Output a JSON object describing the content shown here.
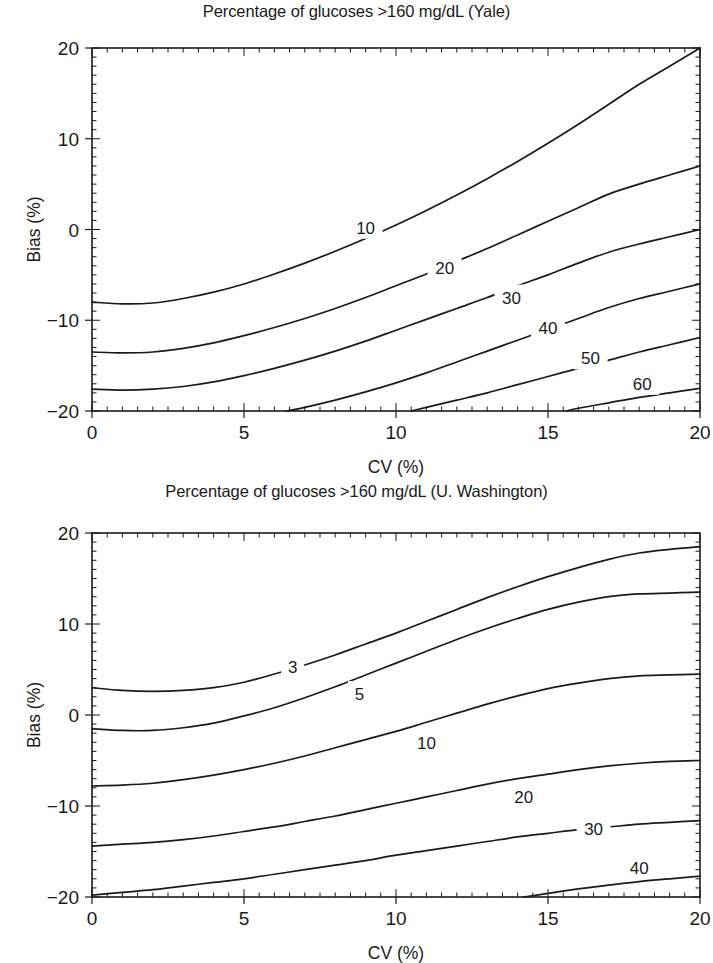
{
  "figure": {
    "background": "#ffffff",
    "line_color": "#1a1a1a"
  },
  "panels": [
    {
      "id": "yale",
      "title": "Percentage of glucoses >160 mg/dL (Yale)",
      "xlabel": "CV (%)",
      "ylabel": "Bias (%)"
    },
    {
      "id": "uwashington",
      "title": "Percentage of glucoses >160 mg/dL (U. Washington)",
      "xlabel": "CV (%)",
      "ylabel": "Bias (%)"
    }
  ],
  "chart_data": [
    {
      "type": "line",
      "id": "yale",
      "title": "Percentage of glucoses >160 mg/dL (Yale)",
      "xlabel": "CV (%)",
      "ylabel": "Bias (%)",
      "xlim": [
        0,
        20
      ],
      "ylim": [
        -20,
        20
      ],
      "xticks": [
        0,
        5,
        10,
        15,
        20
      ],
      "yticks": [
        -20,
        -10,
        0,
        10,
        20
      ],
      "xtick_labels": [
        "0",
        "5",
        "10",
        "15",
        "20"
      ],
      "ytick_labels": [
        "-20",
        "-10",
        "0",
        "10",
        "20"
      ],
      "grid": false,
      "legend": "none",
      "contour_label_unit": "%",
      "series": [
        {
          "name": "10",
          "label_at": [
            9.0,
            0.2
          ],
          "x": [
            0,
            1,
            2,
            3,
            4,
            5,
            6,
            7,
            8,
            9,
            10,
            11,
            12,
            13,
            14,
            15,
            16,
            17,
            18,
            19,
            20
          ],
          "y": [
            -8.0,
            -8.2,
            -8.1,
            -7.6,
            -6.9,
            -6.0,
            -4.9,
            -3.7,
            -2.4,
            -1.0,
            0.5,
            2.1,
            3.8,
            5.6,
            7.5,
            9.5,
            11.6,
            13.8,
            16.0,
            18.0,
            20.0
          ]
        },
        {
          "name": "20",
          "label_at": [
            11.6,
            -4.2
          ],
          "x": [
            0,
            1,
            2,
            3,
            4,
            5,
            6,
            7,
            8,
            9,
            10,
            11,
            12,
            13,
            14,
            15,
            16,
            17,
            18,
            19,
            20
          ],
          "y": [
            -13.5,
            -13.6,
            -13.5,
            -13.1,
            -12.5,
            -11.7,
            -10.8,
            -9.8,
            -8.7,
            -7.5,
            -6.2,
            -4.9,
            -3.5,
            -2.1,
            -0.6,
            0.9,
            2.4,
            3.9,
            5.0,
            6.0,
            7.0
          ]
        },
        {
          "name": "30",
          "label_at": [
            13.8,
            -7.5
          ],
          "x": [
            0,
            1,
            2,
            3,
            4,
            5,
            6,
            7,
            8,
            9,
            10,
            11,
            12,
            13,
            14,
            15,
            16,
            17,
            18,
            19,
            20
          ],
          "y": [
            -17.6,
            -17.7,
            -17.6,
            -17.3,
            -16.8,
            -16.1,
            -15.3,
            -14.4,
            -13.4,
            -12.3,
            -11.1,
            -9.9,
            -8.7,
            -7.5,
            -6.2,
            -5.0,
            -3.7,
            -2.5,
            -1.6,
            -0.8,
            0.0
          ]
        },
        {
          "name": "40",
          "label_at": [
            15.0,
            -10.9
          ],
          "x": [
            6.4,
            7,
            8,
            9,
            10,
            11,
            12,
            13,
            14,
            15,
            16,
            17,
            18,
            19,
            20
          ],
          "y": [
            -20.0,
            -19.6,
            -18.8,
            -17.9,
            -16.9,
            -15.8,
            -14.6,
            -13.4,
            -12.2,
            -11.0,
            -9.8,
            -8.6,
            -7.6,
            -6.8,
            -6.0
          ]
        },
        {
          "name": "50",
          "label_at": [
            16.4,
            -14.2
          ],
          "x": [
            10.5,
            11,
            12,
            13,
            14,
            15,
            16,
            17,
            18,
            19,
            20
          ],
          "y": [
            -20.0,
            -19.6,
            -18.8,
            -18.0,
            -17.1,
            -16.2,
            -15.3,
            -14.4,
            -13.5,
            -12.7,
            -11.9
          ]
        },
        {
          "name": "60",
          "label_at": [
            18.1,
            -17.0
          ],
          "x": [
            15.6,
            16,
            17,
            18,
            19,
            20
          ],
          "y": [
            -20.0,
            -19.7,
            -19.1,
            -18.5,
            -18.0,
            -17.5
          ]
        }
      ]
    },
    {
      "type": "line",
      "id": "uwashington",
      "title": "Percentage of glucoses >160 mg/dL (U. Washington)",
      "xlabel": "CV (%)",
      "ylabel": "Bias (%)",
      "xlim": [
        0,
        20
      ],
      "ylim": [
        -20,
        20
      ],
      "xticks": [
        0,
        5,
        10,
        15,
        20
      ],
      "yticks": [
        -20,
        -10,
        0,
        10,
        20
      ],
      "xtick_labels": [
        "0",
        "5",
        "10",
        "15",
        "20"
      ],
      "ytick_labels": [
        "-20",
        "-10",
        "0",
        "10",
        "20"
      ],
      "grid": false,
      "legend": "none",
      "contour_label_unit": "%",
      "series": [
        {
          "name": "3",
          "label_at": [
            6.6,
            5.3
          ],
          "x": [
            0,
            1,
            2,
            3,
            4,
            5,
            6,
            7,
            8,
            9,
            10,
            11,
            12,
            13,
            14,
            15,
            16,
            17,
            18,
            19,
            20
          ],
          "y": [
            3.0,
            2.7,
            2.6,
            2.7,
            3.0,
            3.6,
            4.5,
            5.5,
            6.6,
            7.8,
            9.0,
            10.3,
            11.6,
            12.9,
            14.1,
            15.2,
            16.2,
            17.1,
            17.8,
            18.2,
            18.5
          ]
        },
        {
          "name": "5",
          "label_at": [
            8.8,
            2.3
          ],
          "x": [
            0,
            1,
            2,
            3,
            4,
            5,
            6,
            7,
            8,
            9,
            10,
            11,
            12,
            13,
            14,
            15,
            16,
            17,
            18,
            19,
            20
          ],
          "y": [
            -1.5,
            -1.7,
            -1.7,
            -1.4,
            -0.9,
            -0.1,
            0.8,
            1.9,
            3.1,
            4.4,
            5.7,
            7.0,
            8.3,
            9.5,
            10.6,
            11.6,
            12.4,
            13.0,
            13.3,
            13.4,
            13.5
          ]
        },
        {
          "name": "10",
          "label_at": [
            11.0,
            -3.1
          ],
          "x": [
            0,
            1,
            2,
            3,
            4,
            5,
            6,
            7,
            8,
            9,
            10,
            11,
            12,
            13,
            14,
            15,
            16,
            17,
            18,
            19,
            20
          ],
          "y": [
            -7.8,
            -7.7,
            -7.5,
            -7.1,
            -6.6,
            -6.0,
            -5.3,
            -4.5,
            -3.6,
            -2.7,
            -1.8,
            -0.8,
            0.2,
            1.2,
            2.1,
            2.9,
            3.5,
            4.0,
            4.3,
            4.4,
            4.5
          ]
        },
        {
          "name": "20",
          "label_at": [
            14.2,
            -9.0
          ],
          "x": [
            0,
            1,
            2,
            3,
            4,
            5,
            6,
            7,
            8,
            9,
            10,
            11,
            12,
            13,
            14,
            15,
            16,
            17,
            18,
            19,
            20
          ],
          "y": [
            -14.4,
            -14.2,
            -14.0,
            -13.7,
            -13.3,
            -12.8,
            -12.3,
            -11.7,
            -11.1,
            -10.4,
            -9.7,
            -9.0,
            -8.3,
            -7.6,
            -7.0,
            -6.5,
            -6.0,
            -5.6,
            -5.3,
            -5.1,
            -5.0
          ]
        },
        {
          "name": "30",
          "label_at": [
            16.5,
            -12.5
          ],
          "x": [
            0,
            1,
            2,
            3,
            4,
            5,
            6,
            7,
            8,
            9,
            10,
            11,
            12,
            13,
            14,
            15,
            16,
            17,
            18,
            19,
            20
          ],
          "y": [
            -19.8,
            -19.5,
            -19.2,
            -18.8,
            -18.4,
            -18.0,
            -17.5,
            -17.0,
            -16.5,
            -16.0,
            -15.4,
            -14.9,
            -14.4,
            -13.9,
            -13.4,
            -13.0,
            -12.6,
            -12.3,
            -12.0,
            -11.8,
            -11.6
          ]
        },
        {
          "name": "40",
          "label_at": [
            18.0,
            -16.8
          ],
          "x": [
            14.2,
            15,
            16,
            17,
            18,
            19,
            20
          ],
          "y": [
            -20.0,
            -19.6,
            -19.1,
            -18.7,
            -18.3,
            -18.0,
            -17.7
          ]
        }
      ]
    }
  ]
}
